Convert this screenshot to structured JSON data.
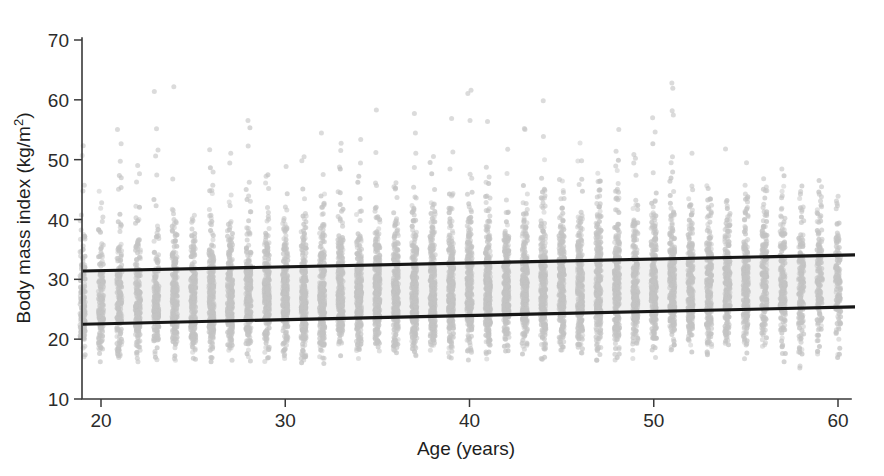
{
  "figure": {
    "title": "",
    "background_color": "#ffffff"
  },
  "axes": {
    "x": {
      "label": "Age (years)",
      "ticks": [
        20,
        30,
        40,
        50,
        60
      ],
      "tick_labels": [
        "20",
        "30",
        "40",
        "50",
        "60"
      ],
      "range": [
        18.9,
        60.8
      ]
    },
    "y": {
      "label_main": "Body mass index (kg/m",
      "label_sup": "2",
      "label_close": ")",
      "label_full": "Body mass index (kg/m2)",
      "ticks": [
        10,
        20,
        30,
        40,
        50,
        60,
        70
      ],
      "tick_labels": [
        "10",
        "20",
        "30",
        "40",
        "50",
        "60",
        "70"
      ],
      "range": [
        9.2,
        71.0
      ]
    }
  },
  "colors": {
    "point": "#c3c3c3",
    "fit_line": "#171717",
    "band": "#f0f0f0",
    "axis": "#3a3a3a",
    "text": "#1e1e1e"
  },
  "chart_data": {
    "type": "scatter",
    "title": "",
    "xlabel": "Age (years)",
    "ylabel": "Body mass index (kg/m2)",
    "xlim": [
      18.9,
      60.8
    ],
    "ylim": [
      9.2,
      71.0
    ],
    "grid": false,
    "legend": "none",
    "xticks": [
      20,
      30,
      40,
      50,
      60
    ],
    "yticks": [
      10,
      20,
      30,
      40,
      50,
      60,
      70
    ],
    "point_style": {
      "marker": "o",
      "color": "#c3c3c3",
      "size": 3.2,
      "alpha": 0.75
    },
    "series": [
      {
        "name": "Upper reference line",
        "type": "line",
        "x": [
          19.0,
          60.0
        ],
        "y": [
          31.4,
          34.0
        ]
      },
      {
        "name": "Lower reference line",
        "type": "line",
        "x": [
          19.0,
          60.0
        ],
        "y": [
          22.5,
          25.3
        ]
      }
    ],
    "shaded_band": {
      "name": "Between-lines band",
      "x": [
        19.0,
        60.0
      ],
      "y_lower": [
        22.5,
        25.3
      ],
      "y_upper": [
        31.4,
        34.0
      ],
      "color": "#f0f0f0"
    },
    "columns": [
      {
        "age": 19,
        "n": 140,
        "min": 16.2,
        "q1": 23.4,
        "median": 26.3,
        "q3": 30.1,
        "max": 53.0
      },
      {
        "age": 20,
        "n": 150,
        "min": 15.0,
        "q1": 23.2,
        "median": 26.2,
        "q3": 30.0,
        "max": 46.0
      },
      {
        "age": 21,
        "n": 165,
        "min": 16.4,
        "q1": 23.3,
        "median": 26.4,
        "q3": 30.3,
        "max": 55.5
      },
      {
        "age": 22,
        "n": 170,
        "min": 14.4,
        "q1": 23.2,
        "median": 26.3,
        "q3": 30.2,
        "max": 50.0
      },
      {
        "age": 23,
        "n": 180,
        "min": 16.0,
        "q1": 23.4,
        "median": 26.5,
        "q3": 30.5,
        "max": 64.5
      },
      {
        "age": 24,
        "n": 190,
        "min": 16.3,
        "q1": 23.5,
        "median": 26.6,
        "q3": 30.6,
        "max": 64.0
      },
      {
        "age": 25,
        "n": 200,
        "min": 15.8,
        "q1": 23.6,
        "median": 26.7,
        "q3": 30.8,
        "max": 57.0
      },
      {
        "age": 26,
        "n": 210,
        "min": 16.1,
        "q1": 23.7,
        "median": 26.9,
        "q3": 31.0,
        "max": 54.0
      },
      {
        "age": 27,
        "n": 215,
        "min": 16.0,
        "q1": 23.8,
        "median": 27.0,
        "q3": 31.1,
        "max": 57.5
      },
      {
        "age": 28,
        "n": 220,
        "min": 15.5,
        "q1": 23.9,
        "median": 27.1,
        "q3": 31.3,
        "max": 57.5
      },
      {
        "age": 29,
        "n": 225,
        "min": 16.2,
        "q1": 24.0,
        "median": 27.2,
        "q3": 31.4,
        "max": 50.0
      },
      {
        "age": 30,
        "n": 230,
        "min": 15.9,
        "q1": 24.0,
        "median": 27.3,
        "q3": 31.5,
        "max": 51.0
      },
      {
        "age": 31,
        "n": 235,
        "min": 16.0,
        "q1": 24.1,
        "median": 27.4,
        "q3": 31.6,
        "max": 53.5
      },
      {
        "age": 32,
        "n": 240,
        "min": 15.3,
        "q1": 24.2,
        "median": 27.5,
        "q3": 31.8,
        "max": 61.0
      },
      {
        "age": 33,
        "n": 245,
        "min": 16.4,
        "q1": 24.2,
        "median": 27.5,
        "q3": 31.8,
        "max": 55.0
      },
      {
        "age": 34,
        "n": 248,
        "min": 16.1,
        "q1": 24.3,
        "median": 27.6,
        "q3": 31.9,
        "max": 60.5
      },
      {
        "age": 35,
        "n": 250,
        "min": 15.7,
        "q1": 24.4,
        "median": 27.7,
        "q3": 32.0,
        "max": 60.0
      },
      {
        "age": 36,
        "n": 252,
        "min": 16.0,
        "q1": 24.4,
        "median": 27.8,
        "q3": 32.1,
        "max": 56.0
      },
      {
        "age": 37,
        "n": 255,
        "min": 15.4,
        "q1": 24.5,
        "median": 27.9,
        "q3": 32.2,
        "max": 58.5
      },
      {
        "age": 38,
        "n": 255,
        "min": 16.2,
        "q1": 24.5,
        "median": 27.9,
        "q3": 32.3,
        "max": 51.0
      },
      {
        "age": 39,
        "n": 258,
        "min": 15.9,
        "q1": 24.6,
        "median": 28.0,
        "q3": 32.4,
        "max": 57.0
      },
      {
        "age": 40,
        "n": 260,
        "min": 16.1,
        "q1": 24.6,
        "median": 28.0,
        "q3": 32.5,
        "max": 66.5
      },
      {
        "age": 41,
        "n": 258,
        "min": 15.8,
        "q1": 24.7,
        "median": 28.1,
        "q3": 32.6,
        "max": 56.5
      },
      {
        "age": 42,
        "n": 255,
        "min": 16.3,
        "q1": 24.7,
        "median": 28.1,
        "q3": 32.6,
        "max": 52.0
      },
      {
        "age": 43,
        "n": 252,
        "min": 16.0,
        "q1": 24.8,
        "median": 28.2,
        "q3": 32.7,
        "max": 58.0
      },
      {
        "age": 44,
        "n": 250,
        "min": 15.6,
        "q1": 24.8,
        "median": 28.2,
        "q3": 32.7,
        "max": 62.0
      },
      {
        "age": 45,
        "n": 248,
        "min": 16.2,
        "q1": 24.9,
        "median": 28.3,
        "q3": 32.8,
        "max": 54.0
      },
      {
        "age": 46,
        "n": 245,
        "min": 16.4,
        "q1": 24.9,
        "median": 28.3,
        "q3": 32.9,
        "max": 56.0
      },
      {
        "age": 47,
        "n": 240,
        "min": 16.0,
        "q1": 25.0,
        "median": 28.4,
        "q3": 32.9,
        "max": 51.5
      },
      {
        "age": 48,
        "n": 235,
        "min": 15.8,
        "q1": 25.0,
        "median": 28.4,
        "q3": 33.0,
        "max": 58.5
      },
      {
        "age": 49,
        "n": 230,
        "min": 16.1,
        "q1": 25.1,
        "median": 28.5,
        "q3": 33.0,
        "max": 57.0
      },
      {
        "age": 50,
        "n": 225,
        "min": 16.3,
        "q1": 25.1,
        "median": 28.5,
        "q3": 33.1,
        "max": 61.5
      },
      {
        "age": 51,
        "n": 220,
        "min": 16.0,
        "q1": 25.2,
        "median": 28.6,
        "q3": 33.1,
        "max": 64.5
      },
      {
        "age": 52,
        "n": 212,
        "min": 15.9,
        "q1": 25.2,
        "median": 28.6,
        "q3": 33.2,
        "max": 52.0
      },
      {
        "age": 53,
        "n": 205,
        "min": 16.2,
        "q1": 25.3,
        "median": 28.7,
        "q3": 33.2,
        "max": 50.5
      },
      {
        "age": 54,
        "n": 198,
        "min": 16.5,
        "q1": 25.3,
        "median": 28.7,
        "q3": 33.3,
        "max": 54.5
      },
      {
        "age": 55,
        "n": 190,
        "min": 16.1,
        "q1": 25.4,
        "median": 28.8,
        "q3": 33.3,
        "max": 54.5
      },
      {
        "age": 56,
        "n": 180,
        "min": 16.4,
        "q1": 25.4,
        "median": 28.8,
        "q3": 33.4,
        "max": 49.5
      },
      {
        "age": 57,
        "n": 170,
        "min": 16.0,
        "q1": 25.5,
        "median": 28.9,
        "q3": 33.4,
        "max": 52.0
      },
      {
        "age": 58,
        "n": 158,
        "min": 14.4,
        "q1": 25.5,
        "median": 28.9,
        "q3": 33.5,
        "max": 54.0
      },
      {
        "age": 59,
        "n": 142,
        "min": 16.3,
        "q1": 25.6,
        "median": 29.0,
        "q3": 33.5,
        "max": 48.5
      },
      {
        "age": 60,
        "n": 120,
        "min": 16.6,
        "q1": 25.6,
        "median": 29.0,
        "q3": 33.6,
        "max": 44.0
      }
    ]
  }
}
